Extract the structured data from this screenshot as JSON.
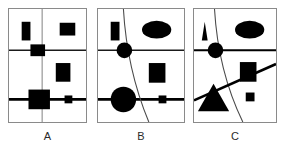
{
  "figure": {
    "title": "",
    "background_color": "#ffffff",
    "ink_color": "#000000",
    "frame_color": "#8a8a8a",
    "panel_count": 3
  },
  "captions": {
    "a": "A",
    "b": "B",
    "c": "C"
  },
  "panels": [
    {
      "id": "A",
      "label": "A",
      "lines": {
        "vertical_thin": "x=34 from top to bottom",
        "horizontal_thin": "y=42 full width",
        "horizontal_thick": "y=92 full width"
      },
      "shapes": [
        {
          "name": "tall-rectangle",
          "kind": "rectangle",
          "region": "top-left",
          "fill": "#000000"
        },
        {
          "name": "square-top-right",
          "kind": "rectangle",
          "region": "top-right",
          "fill": "#000000"
        },
        {
          "name": "square-on-left-node",
          "kind": "rectangle",
          "region": "mid-left-intersection",
          "fill": "#000000"
        },
        {
          "name": "rectangle-middle-right",
          "kind": "rectangle",
          "region": "middle-right",
          "fill": "#000000"
        },
        {
          "name": "large-square-bottom-left",
          "kind": "rectangle",
          "region": "bottom-left-intersection",
          "fill": "#000000"
        },
        {
          "name": "small-square-on-thick-line",
          "kind": "rectangle",
          "region": "bottom-right",
          "fill": "#000000"
        }
      ]
    },
    {
      "id": "B",
      "label": "B",
      "lines": {
        "curve": "concave arc from top-left down to bottom-center",
        "horizontal_thin": "y=42 full width",
        "horizontal_thick": "y=92 full width"
      },
      "shapes": [
        {
          "name": "tall-rectangle",
          "kind": "rectangle",
          "region": "top-left",
          "fill": "#000000"
        },
        {
          "name": "ellipse-top-right",
          "kind": "ellipse",
          "region": "top-right",
          "fill": "#000000"
        },
        {
          "name": "small-circle-on-left-node",
          "kind": "circle",
          "region": "mid-left-intersection",
          "fill": "#000000"
        },
        {
          "name": "rectangle-middle-right",
          "kind": "rectangle",
          "region": "middle-right",
          "fill": "#000000"
        },
        {
          "name": "large-circle-bottom-left",
          "kind": "circle",
          "region": "bottom-left-intersection",
          "fill": "#000000"
        },
        {
          "name": "small-square-on-thick-line",
          "kind": "rectangle",
          "region": "bottom-right",
          "fill": "#000000"
        }
      ]
    },
    {
      "id": "C",
      "label": "C",
      "lines": {
        "curve": "concave arc from top-left down to bottom-center",
        "horizontal_thick_upper": "y=42 full width",
        "diagonal_thick": "rising line from bottom-left to right edge"
      },
      "shapes": [
        {
          "name": "small-triangle-top-left",
          "kind": "triangle",
          "region": "top-left",
          "fill": "#000000"
        },
        {
          "name": "ellipse-top-right",
          "kind": "ellipse",
          "region": "top-right",
          "fill": "#000000"
        },
        {
          "name": "small-circle-on-left-node",
          "kind": "circle",
          "region": "mid-left-intersection",
          "fill": "#000000"
        },
        {
          "name": "rectangle-middle-right",
          "kind": "rectangle",
          "region": "middle-right",
          "fill": "#000000"
        },
        {
          "name": "large-triangle-bottom-left",
          "kind": "triangle",
          "region": "bottom-left",
          "fill": "#000000"
        },
        {
          "name": "small-square-bottom-right",
          "kind": "rectangle",
          "region": "bottom-right",
          "fill": "#000000"
        }
      ]
    }
  ]
}
